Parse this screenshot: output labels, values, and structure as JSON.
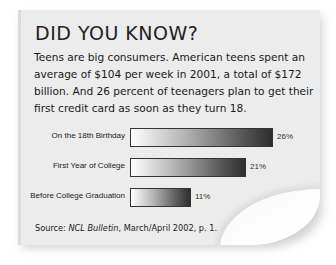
{
  "card": {
    "title": "DID YOU KNOW?",
    "body": "Teens are big consumers. American teens spent an average of $104 per week in 2001, a total of $172 billion. And 26 percent of teenagers plan to get their first credit card as soon as they turn 18.",
    "source": {
      "prefix": "Source: ",
      "publication": "NCL Bulletin",
      "suffix": ", March/April 2002, p. 1."
    }
  },
  "chart_data": {
    "type": "bar",
    "orientation": "horizontal",
    "title": "",
    "categories": [
      "On the 18th Birthday",
      "First Year of College",
      "Before College Graduation"
    ],
    "values": [
      26,
      21,
      11
    ],
    "value_labels": [
      "26%",
      "21%",
      "11%"
    ],
    "xlabel": "",
    "ylabel": "",
    "xlim": [
      0,
      30
    ],
    "grid": false,
    "legend": null,
    "bar_fill": "gradient white to dark gray",
    "bar_border": "#333333"
  },
  "colors": {
    "card_background": "#ececec",
    "text": "#1a1a1a",
    "bar_dark": "#2e2e2e",
    "bar_light": "#ffffff"
  }
}
